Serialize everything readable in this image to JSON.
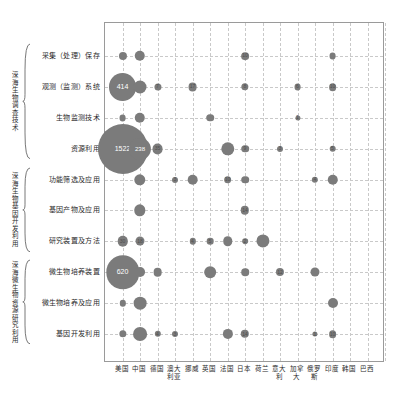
{
  "chart_data": {
    "type": "scatter",
    "title": "",
    "xlabel": "",
    "ylabel": "",
    "grid": true,
    "legend": "none",
    "note": "Bubble matrix: bubble area encodes patent counts per country per technology topic",
    "categories": [
      "美国",
      "中国",
      "德国",
      "澳大利亚",
      "挪威",
      "英国",
      "法国",
      "日本",
      "荷兰",
      "意大利",
      "加拿大",
      "俄罗斯",
      "印度",
      "韩国",
      "巴西"
    ],
    "rows": [
      "采集（处理）保存",
      "观测（监测）系统",
      "生物监测技术",
      "资源利用",
      "功能筛选及应用",
      "基因产物及应用",
      "研究装置及方法",
      "微生物培养装置",
      "微生物培养及应用",
      "基因开发利用"
    ],
    "groups": [
      {
        "name": "深海生物调查技术",
        "rows": [
          "采集（处理）保存",
          "观测（监测）系统",
          "生物监测技术",
          "资源利用"
        ]
      },
      {
        "name": "深海生物基因开发利用",
        "rows": [
          "功能筛选及应用",
          "基因产物及应用",
          "研究装置及方法"
        ]
      },
      {
        "name": "深海微生物资源研究利用",
        "rows": [
          "微生物培养装置",
          "微生物培养及应用",
          "基因开发利用"
        ]
      }
    ],
    "bubble_color": "#7b7b7b",
    "points": [
      {
        "row": 0,
        "col": 0,
        "value": 12
      },
      {
        "row": 0,
        "col": 1,
        "value": 30
      },
      {
        "row": 0,
        "col": 7,
        "value": 10,
        "label": "10"
      },
      {
        "row": 0,
        "col": 12,
        "value": 6
      },
      {
        "row": 1,
        "col": 0,
        "value": 414,
        "label": "414"
      },
      {
        "row": 1,
        "col": 1,
        "value": 58
      },
      {
        "row": 1,
        "col": 2,
        "value": 7,
        "label": "7"
      },
      {
        "row": 1,
        "col": 4,
        "value": 17,
        "label": "17"
      },
      {
        "row": 1,
        "col": 7,
        "value": 8,
        "label": "8"
      },
      {
        "row": 1,
        "col": 10,
        "value": 6,
        "label": "6"
      },
      {
        "row": 1,
        "col": 12,
        "value": 10,
        "label": "10"
      },
      {
        "row": 2,
        "col": 0,
        "value": 6
      },
      {
        "row": 2,
        "col": 1,
        "value": 30
      },
      {
        "row": 2,
        "col": 5,
        "value": 9
      },
      {
        "row": 2,
        "col": 10,
        "value": 1,
        "label": "1"
      },
      {
        "row": 3,
        "col": 0,
        "value": 1522,
        "label": "1522"
      },
      {
        "row": 3,
        "col": 1,
        "value": 238,
        "label": "238"
      },
      {
        "row": 3,
        "col": 2,
        "value": 35,
        "label": "35"
      },
      {
        "row": 3,
        "col": 6,
        "value": 64
      },
      {
        "row": 3,
        "col": 7,
        "value": 9,
        "label": "9"
      },
      {
        "row": 3,
        "col": 9,
        "value": 3,
        "label": "3"
      },
      {
        "row": 3,
        "col": 12,
        "value": 5,
        "label": "5"
      },
      {
        "row": 4,
        "col": 1,
        "value": 40
      },
      {
        "row": 4,
        "col": 3,
        "value": 3,
        "label": "3"
      },
      {
        "row": 4,
        "col": 4,
        "value": 32
      },
      {
        "row": 4,
        "col": 6,
        "value": 10,
        "label": "10"
      },
      {
        "row": 4,
        "col": 7,
        "value": 9
      },
      {
        "row": 4,
        "col": 11,
        "value": 4,
        "label": "4"
      },
      {
        "row": 4,
        "col": 12,
        "value": 30
      },
      {
        "row": 5,
        "col": 1,
        "value": 40
      },
      {
        "row": 5,
        "col": 7,
        "value": 14,
        "label": "14"
      },
      {
        "row": 6,
        "col": 0,
        "value": 30,
        "label": "30"
      },
      {
        "row": 6,
        "col": 1,
        "value": 18,
        "label": "18"
      },
      {
        "row": 6,
        "col": 4,
        "value": 4,
        "label": "4"
      },
      {
        "row": 6,
        "col": 5,
        "value": 5,
        "label": "5"
      },
      {
        "row": 6,
        "col": 6,
        "value": 22
      },
      {
        "row": 6,
        "col": 7,
        "value": 2,
        "label": "2"
      },
      {
        "row": 6,
        "col": 8,
        "value": 60
      },
      {
        "row": 7,
        "col": 0,
        "value": 620,
        "label": "620"
      },
      {
        "row": 7,
        "col": 1,
        "value": 25
      },
      {
        "row": 7,
        "col": 2,
        "value": 16
      },
      {
        "row": 7,
        "col": 5,
        "value": 42
      },
      {
        "row": 7,
        "col": 7,
        "value": 9
      },
      {
        "row": 7,
        "col": 9,
        "value": 12,
        "label": "12"
      },
      {
        "row": 7,
        "col": 11,
        "value": 18
      },
      {
        "row": 8,
        "col": 0,
        "value": 4
      },
      {
        "row": 8,
        "col": 1,
        "value": 55
      },
      {
        "row": 8,
        "col": 12,
        "value": 26
      },
      {
        "row": 9,
        "col": 0,
        "value": 8
      },
      {
        "row": 9,
        "col": 1,
        "value": 70
      },
      {
        "row": 9,
        "col": 2,
        "value": 4,
        "label": "4"
      },
      {
        "row": 9,
        "col": 3,
        "value": 3,
        "label": "3"
      },
      {
        "row": 9,
        "col": 6,
        "value": 28
      },
      {
        "row": 9,
        "col": 7,
        "value": 14,
        "label": "14"
      },
      {
        "row": 9,
        "col": 11,
        "value": 1,
        "label": "1"
      },
      {
        "row": 9,
        "col": 12,
        "value": 10,
        "label": "10"
      }
    ]
  }
}
